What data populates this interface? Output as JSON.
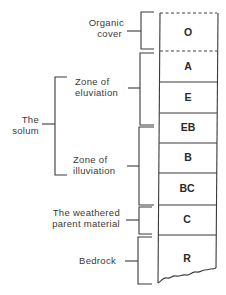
{
  "diagram": {
    "horizons": [
      {
        "label": "O",
        "top": 13,
        "bottom": 51,
        "top_line": "dashed"
      },
      {
        "label": "A",
        "top": 51,
        "bottom": 82,
        "top_line": "dashed"
      },
      {
        "label": "E",
        "top": 82,
        "bottom": 113,
        "top_line": "solid"
      },
      {
        "label": "EB",
        "top": 113,
        "bottom": 143,
        "top_line": "solid"
      },
      {
        "label": "B",
        "top": 143,
        "bottom": 173,
        "top_line": "solid"
      },
      {
        "label": "BC",
        "top": 173,
        "bottom": 205,
        "top_line": "solid"
      },
      {
        "label": "C",
        "top": 205,
        "bottom": 235,
        "top_line": "solid"
      },
      {
        "label": "R",
        "top": 235,
        "bottom": 283,
        "top_line": "solid"
      }
    ],
    "brackets": [
      {
        "name": "organic-cover",
        "lines": [
          "Organic",
          "cover"
        ],
        "top": 12,
        "bottom": 49
      },
      {
        "name": "zone-of-eluviation",
        "lines": [
          "Zone of",
          "eluviation"
        ],
        "top": 53,
        "bottom": 125
      },
      {
        "name": "zone-of-illuviation",
        "lines": [
          "Zone of",
          "illuviation"
        ],
        "top": 127,
        "bottom": 205
      },
      {
        "name": "weathered-parent-material",
        "lines": [
          "The weathered",
          "parent material"
        ],
        "top": 207,
        "bottom": 235
      },
      {
        "name": "bedrock",
        "lines": [
          "Bedrock"
        ],
        "top": 237,
        "bottom": 284
      }
    ],
    "outer_bracket": {
      "name": "the-solum",
      "lines": [
        "The",
        "solum"
      ],
      "top": 77,
      "bottom": 175
    }
  }
}
